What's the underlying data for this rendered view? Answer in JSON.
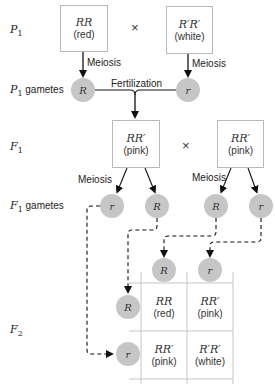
{
  "rows": {
    "p1": {
      "label": "P",
      "sub": "1"
    },
    "p1_gametes": {
      "label": "P",
      "sub": "1",
      "suffix": " gametes"
    },
    "f1": {
      "label": "F",
      "sub": "1"
    },
    "f1_gametes": {
      "label": "F",
      "sub": "1",
      "suffix": " gametes"
    },
    "f2": {
      "label": "F",
      "sub": "2"
    }
  },
  "p1": {
    "left": {
      "genotype": "RR",
      "phenotype": "(red)"
    },
    "right": {
      "genotype": "R′R′",
      "phenotype": "(white)"
    },
    "cross": "×"
  },
  "labels": {
    "meiosis": "Meiosis",
    "fertilization": "Fertilization"
  },
  "p1_gametes": [
    "R",
    "r"
  ],
  "f1": {
    "left": {
      "genotype": "RR′",
      "phenotype": "(pink)"
    },
    "right": {
      "genotype": "RR′",
      "phenotype": "(pink)"
    },
    "cross": "×"
  },
  "f1_gametes": [
    "r",
    "R",
    "R",
    "r"
  ],
  "punnett": {
    "col_gametes": [
      "R",
      "r"
    ],
    "row_gametes": [
      "R",
      "r"
    ],
    "cells": [
      [
        {
          "genotype": "RR",
          "phenotype": "(red)"
        },
        {
          "genotype": "RR′",
          "phenotype": "(pink)"
        }
      ],
      [
        {
          "genotype": "RR′",
          "phenotype": "(pink)"
        },
        {
          "genotype": "R′R′",
          "phenotype": "(white)"
        }
      ]
    ]
  },
  "colors": {
    "gamete_fill": "#c6c6c6",
    "box_border": "#b9b9b9",
    "line": "#111111"
  }
}
